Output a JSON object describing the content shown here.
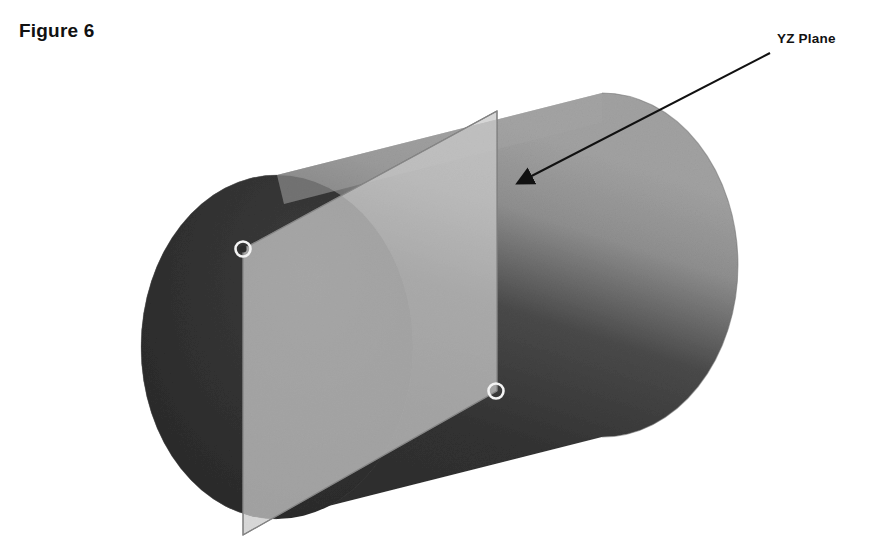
{
  "figure": {
    "caption": "Figure 6",
    "background_color": "#ffffff"
  },
  "callout": {
    "label": "YZ Plane",
    "label_color": "#111111",
    "leader_line_color": "#111111",
    "leader_start": [
      770,
      53
    ],
    "leader_end": [
      512,
      186
    ],
    "arrowhead_at": [
      510,
      187
    ]
  },
  "diagram": {
    "type": "3d-cylinder-with-cutting-plane",
    "projection": "oblique",
    "colors": {
      "cylinder_front_face": "#2e2e2e",
      "cylinder_body_dark": "#3a3a3a",
      "cylinder_body_light": "#9a9a9a",
      "cylinder_top_highlight": "#8e8e8e",
      "plane_fill": "#b9b9b9",
      "plane_edge": "#6e6e6e",
      "marker_stroke": "#f2f2f2",
      "outline": "#2a2a2a"
    },
    "cylinder": {
      "front_face_center": [
        277,
        347
      ],
      "front_face_rx": 136,
      "front_face_ry": 172,
      "axis_offset": [
        325,
        -82
      ],
      "label": "cylinder"
    },
    "cutting_plane": {
      "name": "YZ Plane",
      "left_edge_x": 243,
      "right_edge_x": 497,
      "top_left": [
        243,
        249
      ],
      "top_right": [
        497,
        111
      ],
      "bottom_right": [
        497,
        391
      ],
      "bottom_left": [
        243,
        535
      ],
      "opacity": 0.45
    },
    "markers": [
      {
        "name": "intersection-marker-upper",
        "cx": 243,
        "cy": 249,
        "r": 7
      },
      {
        "name": "intersection-marker-lower",
        "cx": 496,
        "cy": 391,
        "r": 7
      }
    ]
  }
}
